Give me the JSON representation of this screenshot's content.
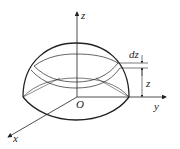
{
  "diagram": {
    "type": "hemisphere-slicing",
    "labels": {
      "z_axis": "z",
      "y_axis": "y",
      "x_axis": "x",
      "origin": "O",
      "dz": "dz",
      "z_height": "z"
    },
    "colors": {
      "stroke": "#222222",
      "background": "#ffffff"
    }
  }
}
